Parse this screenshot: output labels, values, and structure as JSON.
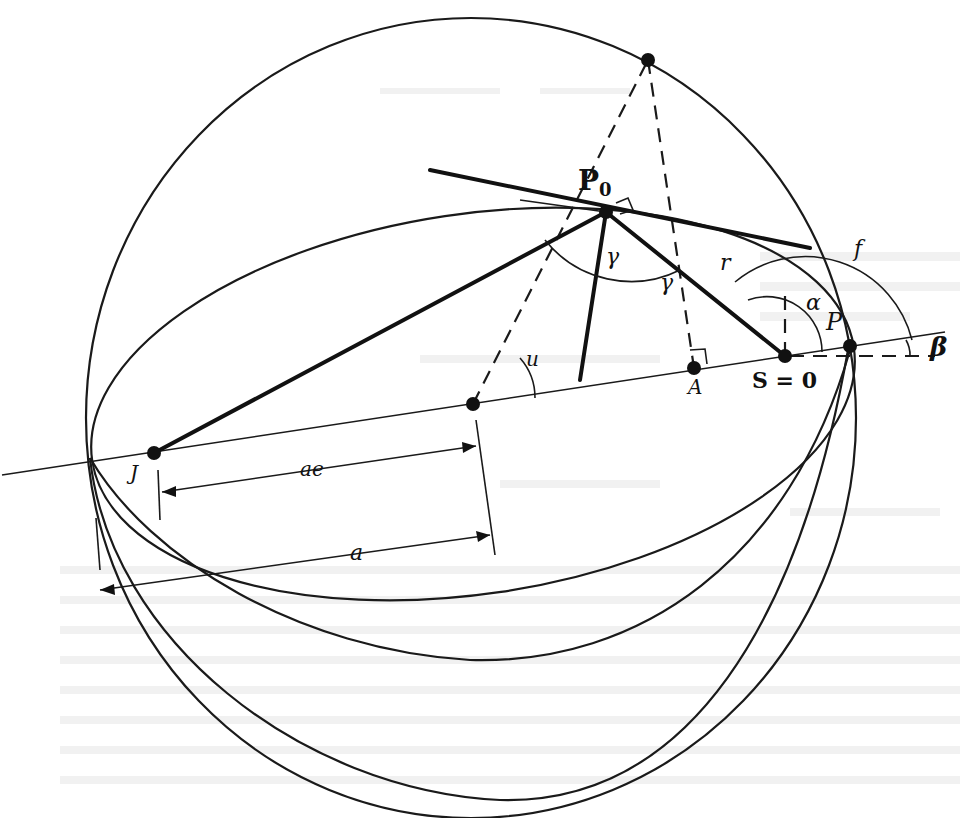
{
  "figure": {
    "type": "orbital-geometry-diagram",
    "background_note": "faint mirrored bleed-through text from reverse page (illegible)"
  },
  "labels": {
    "p0": "P",
    "p0_sub": "0",
    "p": "P",
    "s": "S = 0",
    "a_point": "A",
    "j_point": "J",
    "ae": "ae",
    "a": "a",
    "u": "u",
    "gamma_left": "γ",
    "gamma_mid": "γ",
    "r": "r",
    "f": "f",
    "alpha": "α",
    "beta": "β"
  },
  "points": [
    {
      "id": "P0",
      "x": 606,
      "y": 212
    },
    {
      "id": "P",
      "x": 850,
      "y": 346
    },
    {
      "id": "S",
      "x": 785,
      "y": 356
    },
    {
      "id": "A",
      "x": 694,
      "y": 368
    },
    {
      "id": "J",
      "x": 154,
      "y": 453
    },
    {
      "id": "center",
      "x": 473,
      "y": 404
    },
    {
      "id": "top",
      "x": 648,
      "y": 60
    }
  ],
  "colors": {
    "ink": "#111111",
    "paper": "#ffffff",
    "bleed": "#e6e6e6"
  }
}
